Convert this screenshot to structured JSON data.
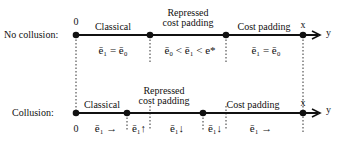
{
  "no_collusion": {
    "row_label": "No collusion:",
    "origin_label": "0",
    "end_label": "x",
    "axis_label": "y",
    "regions": [
      {
        "name": "Classical",
        "condition": "ē₁ = ē₀"
      },
      {
        "name_line1": "Repressed",
        "name_line2": "cost padding",
        "condition": "ē₀ < ē₁ < e*"
      },
      {
        "name": "Cost padding",
        "condition": "ē₁ = ē₀"
      }
    ]
  },
  "collusion": {
    "row_label": "Collusion:",
    "origin_label": "0",
    "end_label": "x",
    "axis_label": "y",
    "regions": [
      {
        "name": "Classical"
      },
      {
        "name_line1": "Repressed",
        "name_line2": "cost padding"
      },
      {
        "name": "Cost padding"
      }
    ],
    "subregion_labels": [
      "ē₁ →",
      "ē₁↑",
      "ē₁↓",
      "ē₁↓",
      "ē₁ →"
    ]
  },
  "colors": {
    "line": "#111111",
    "dotted": "#333333",
    "background": "#ffffff"
  }
}
